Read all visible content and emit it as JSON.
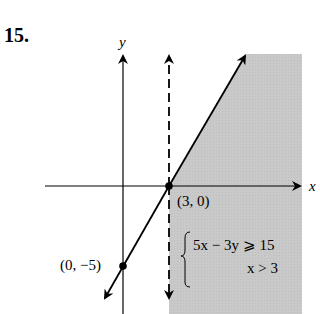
{
  "problem": {
    "number": "15."
  },
  "axes": {
    "x_label": "x",
    "y_label": "y"
  },
  "points": [
    {
      "label": "(3, 0)",
      "x": 3,
      "y": 0
    },
    {
      "label": "(0, −5)",
      "x": 0,
      "y": -5
    }
  ],
  "system": {
    "inequalities": [
      "5x − 3y ⩾ 15",
      "x > 3"
    ]
  },
  "boundary_lines": [
    {
      "equation": "5x − 3y = 15",
      "style": "solid"
    },
    {
      "equation": "x = 3",
      "style": "dashed"
    }
  ],
  "colors": {
    "shade": "#c8c8c8",
    "line": "#000000"
  }
}
